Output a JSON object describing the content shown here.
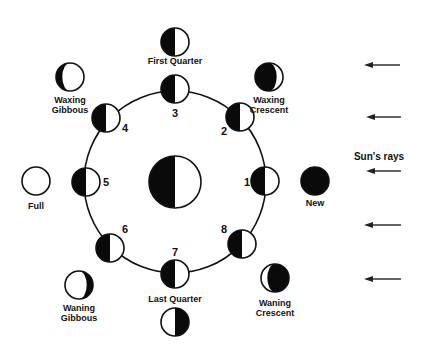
{
  "colors": {
    "dark": "#0a0a0a",
    "light": "#ffffff",
    "stroke": "#111111",
    "arrow": "#222222"
  },
  "orbit": {
    "cx": 175,
    "cy": 182,
    "r": 91
  },
  "earth": {
    "cx": 175,
    "cy": 182,
    "r": 26,
    "lit_side": "right"
  },
  "orbit_positions": [
    {
      "number": "1",
      "cx": 265,
      "cy": 181,
      "num_x": 247,
      "num_y": 186,
      "lit_side": "right"
    },
    {
      "number": "2",
      "cx": 240,
      "cy": 117,
      "num_x": 224,
      "num_y": 135,
      "lit_side": "right"
    },
    {
      "number": "3",
      "cx": 175,
      "cy": 89,
      "num_x": 175,
      "num_y": 117,
      "lit_side": "right"
    },
    {
      "number": "4",
      "cx": 106,
      "cy": 118,
      "num_x": 125,
      "num_y": 132,
      "lit_side": "right"
    },
    {
      "number": "5",
      "cx": 86,
      "cy": 182,
      "num_x": 106,
      "num_y": 186,
      "lit_side": "right"
    },
    {
      "number": "6",
      "cx": 110,
      "cy": 248,
      "num_x": 125,
      "num_y": 233,
      "lit_side": "right"
    },
    {
      "number": "7",
      "cx": 175,
      "cy": 274,
      "num_x": 175,
      "num_y": 256,
      "lit_side": "right"
    },
    {
      "number": "8",
      "cx": 242,
      "cy": 244,
      "num_x": 224,
      "num_y": 233,
      "lit_side": "right"
    }
  ],
  "phase_views": [
    {
      "name": "New",
      "lines": [
        "New"
      ],
      "cx": 315,
      "cy": 181,
      "phase": "new",
      "label_y": 206
    },
    {
      "name": "Waxing Crescent",
      "lines": [
        "Waxing",
        "Crescent"
      ],
      "cx": 269,
      "cy": 77,
      "phase": "waxing-crescent",
      "label_y": 103
    },
    {
      "name": "First Quarter",
      "lines": [
        "First Quarter"
      ],
      "cx": 175,
      "cy": 42,
      "phase": "first-quarter",
      "label_y": 64
    },
    {
      "name": "Waxing Gibbous",
      "lines": [
        "Waxing",
        "Gibbous"
      ],
      "cx": 70,
      "cy": 77,
      "phase": "waxing-gibbous",
      "label_y": 103
    },
    {
      "name": "Full",
      "lines": [
        "Full"
      ],
      "cx": 36,
      "cy": 181,
      "phase": "full",
      "label_y": 209
    },
    {
      "name": "Waning Gibbous",
      "lines": [
        "Waning",
        "Gibbous"
      ],
      "cx": 79,
      "cy": 285,
      "phase": "waning-gibbous",
      "label_y": 311
    },
    {
      "name": "Last Quarter",
      "lines": [
        "Last Quarter"
      ],
      "cx": 175,
      "cy": 322,
      "phase": "last-quarter",
      "label_y": 302,
      "label_above": true
    },
    {
      "name": "Waning Crescent",
      "lines": [
        "Waning",
        "Crescent"
      ],
      "cx": 275,
      "cy": 278,
      "phase": "waning-crescent",
      "label_y": 306
    }
  ],
  "sun": {
    "label": "Sun's rays",
    "label_x": 379,
    "label_y": 160,
    "arrows": [
      {
        "y": 65,
        "x1": 400,
        "x2": 364
      },
      {
        "y": 117,
        "x1": 401,
        "x2": 366
      },
      {
        "y": 171,
        "x1": 401,
        "x2": 366
      },
      {
        "y": 225,
        "x1": 401,
        "x2": 364
      },
      {
        "y": 279,
        "x1": 401,
        "x2": 364
      }
    ]
  }
}
